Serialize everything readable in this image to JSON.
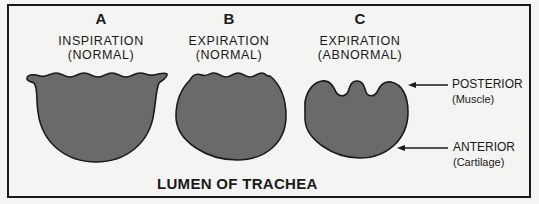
{
  "diagram": {
    "title": "LUMEN OF TRACHEA",
    "panels": [
      {
        "letter": "A",
        "caption_line1": "INSPIRATION",
        "caption_line2": "(NORMAL)"
      },
      {
        "letter": "B",
        "caption_line1": "EXPIRATION",
        "caption_line2": "(NORMAL)"
      },
      {
        "letter": "C",
        "caption_line1": "EXPIRATION",
        "caption_line2": "(ABNORMAL)"
      }
    ],
    "labels": {
      "posterior": {
        "main": "POSTERIOR",
        "sub": "(Muscle)"
      },
      "anterior": {
        "main": "ANTERIOR",
        "sub": "(Cartilage)"
      }
    },
    "colors": {
      "lumen_fill": "#6a6a6a",
      "outline": "#1a1a1a",
      "background": "#f4f4f2"
    }
  }
}
